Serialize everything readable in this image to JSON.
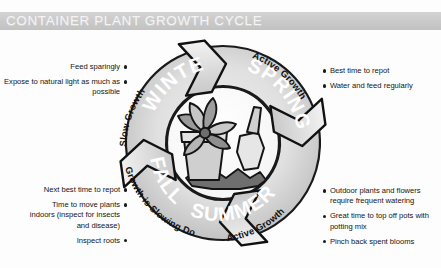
{
  "header": {
    "title": "CONTAINER PLANT GROWTH CYCLE",
    "band_color": "#cccccc",
    "title_color": "#f4f4f4"
  },
  "diagram": {
    "center_illustration": "potted-plant-with-trowel",
    "ring_color_light": "#e3e3e3",
    "ring_color_dark": "#b4b4b4",
    "seasons": [
      {
        "name": "WINTER",
        "outer_label": "Slow Growth"
      },
      {
        "name": "SPRING",
        "outer_label": "Active Growth"
      },
      {
        "name": "SUMMER",
        "outer_label": "Active Growth"
      },
      {
        "name": "FALL",
        "outer_label": "Growth is Slowing Down"
      }
    ]
  },
  "notes": {
    "winter": {
      "items": [
        "Feed sparingly",
        "Expose to natural light as much as possible"
      ]
    },
    "spring": {
      "items": [
        "Best time to repot",
        "Water and feed regularly"
      ]
    },
    "fall": {
      "items": [
        "Next best time to repot",
        "Time to move plants indoors (inspect for insects and disease)",
        "Inspect roots"
      ]
    },
    "summer": {
      "items": [
        "Outdoor plants and flowers require frequent watering",
        "Great time to top off pots with potting mix",
        "Pinch back spent blooms"
      ]
    }
  }
}
